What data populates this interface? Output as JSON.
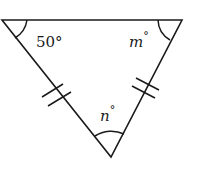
{
  "diagram": {
    "type": "isosceles-triangle",
    "angles": {
      "top_left": "50°",
      "top_right_var": "m",
      "bottom_var": "n",
      "degree": "°"
    },
    "congruent_sides": [
      "left",
      "right"
    ],
    "tick_marks_per_side": 2,
    "stroke_color": "#1a1a1a"
  }
}
